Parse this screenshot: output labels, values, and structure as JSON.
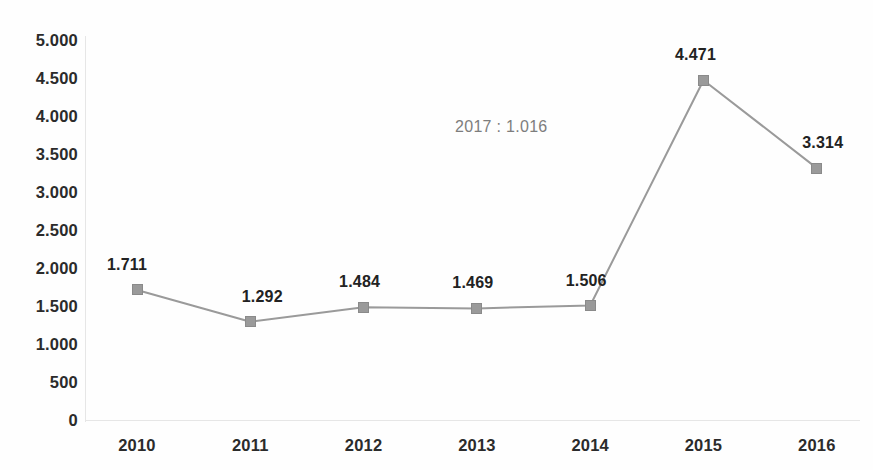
{
  "chart_data": {
    "type": "line",
    "title": "",
    "subtitle": "",
    "xlabel": "",
    "ylabel": "",
    "categories": [
      "2010",
      "2011",
      "2012",
      "2013",
      "2014",
      "2015",
      "2016"
    ],
    "values": [
      1711,
      1292,
      1484,
      1469,
      1506,
      4471,
      3314
    ],
    "point_labels": [
      "1.711",
      "1.292",
      "1.484",
      "1.469",
      "1.506",
      "4.471",
      "3.314"
    ],
    "series": [
      {
        "name": "",
        "values": [
          1711,
          1292,
          1484,
          1469,
          1506,
          4471,
          3314
        ],
        "line_color": "#9a9a9a",
        "marker_color": "#9a9a9a",
        "marker_shape": "square"
      }
    ],
    "ylim": [
      0,
      5000
    ],
    "ytick_values": [
      5000,
      4500,
      4000,
      3500,
      3000,
      2500,
      2000,
      1500,
      1000,
      500,
      0
    ],
    "ytick_labels": [
      "5.000",
      "4.500",
      "4.000",
      "3.500",
      "3.000",
      "2.500",
      "2.000",
      "1.500",
      "1.000",
      "500",
      "0"
    ],
    "xtick_labels": [
      "2010",
      "2011",
      "2012",
      "2013",
      "2014",
      "2015",
      "2016"
    ],
    "grid": false,
    "legend": false,
    "legend_position": "none",
    "annotations": [
      {
        "text": "2017 : 1.016",
        "x_px": 455,
        "y_px": 118,
        "color": "#7d7d7d"
      }
    ],
    "colors": {
      "line": "#9a9a9a",
      "marker": "#9a9a9a",
      "label_text": "#222222",
      "axis_text": "#2b2b2b",
      "annotation_text": "#7d7d7d",
      "axis_line": "#e6e6e6",
      "background": "#fefefe"
    }
  }
}
